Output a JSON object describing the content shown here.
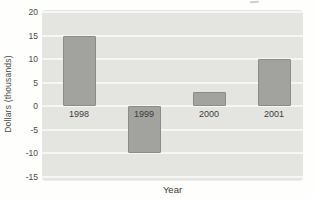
{
  "chart_data": {
    "type": "bar",
    "categories": [
      "1998",
      "1999",
      "2000",
      "2001"
    ],
    "values": [
      15,
      -10,
      3,
      10
    ],
    "title": "",
    "xlabel": "Year",
    "ylabel": "Dollars (thousands)",
    "ylim": [
      -15,
      20
    ],
    "yticks": [
      20,
      15,
      10,
      5,
      0,
      -5,
      -10,
      -15
    ],
    "legend": "none",
    "grid": "horizontal",
    "panel_bg": "#e4e4e1",
    "gridline_color": "#f6f6f4",
    "bar_color": "#a2a29f",
    "bar_border_color": "#8b8b88",
    "text_color": "#4a4a48"
  }
}
